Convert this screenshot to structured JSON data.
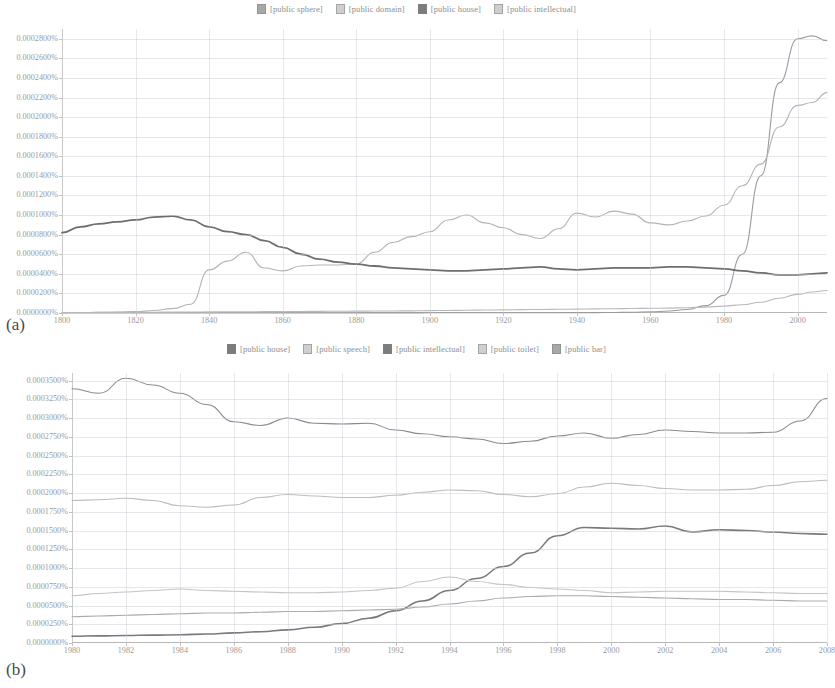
{
  "figure": {
    "panels": [
      {
        "id": "a",
        "caption": "(a)"
      },
      {
        "id": "b",
        "caption": "(b)"
      }
    ]
  },
  "panel_a": {
    "caption": "(a)",
    "legend": [
      {
        "label": "[public sphere]",
        "tone": "mid"
      },
      {
        "label": "[public domain]",
        "tone": "light"
      },
      {
        "label": "[public house]",
        "tone": "dark"
      },
      {
        "label": "[public intellectual]",
        "tone": "light"
      }
    ],
    "yticks": [
      "0.0000000%",
      "0.0000200%",
      "0.0000400%",
      "0.0000600%",
      "0.0000800%",
      "0.0001000%",
      "0.0001200%",
      "0.0001400%",
      "0.0001600%",
      "0.0001800%",
      "0.0002000%",
      "0.0002200%",
      "0.0002400%",
      "0.0002600%",
      "0.0002800%"
    ],
    "xticks": [
      "1800",
      "1820",
      "1840",
      "1860",
      "1880",
      "1900",
      "1920",
      "1940",
      "1960",
      "1980",
      "2000"
    ]
  },
  "panel_b": {
    "caption": "(b)",
    "legend": [
      {
        "label": "[public house]",
        "tone": "dark"
      },
      {
        "label": "[public speech]",
        "tone": "light"
      },
      {
        "label": "[public intellectual]",
        "tone": "dark"
      },
      {
        "label": "[public toilet]",
        "tone": "light"
      },
      {
        "label": "[public bar]",
        "tone": "mid"
      }
    ],
    "yticks": [
      "0.0000000%",
      "0.0000250%",
      "0.0000500%",
      "0.0000750%",
      "0.0001000%",
      "0.0001250%",
      "0.0001500%",
      "0.0001750%",
      "0.0002000%",
      "0.0002250%",
      "0.0002500%",
      "0.0002750%",
      "0.0003000%",
      "0.0003250%",
      "0.0003500%"
    ],
    "xticks": [
      "1980",
      "1982",
      "1984",
      "1986",
      "1988",
      "1990",
      "1992",
      "1994",
      "1996",
      "1998",
      "2000",
      "2002",
      "2004",
      "2006",
      "2008"
    ]
  },
  "chart_data": [
    {
      "type": "line",
      "id": "a",
      "title": "",
      "xlabel": "",
      "ylabel": "",
      "xlim": [
        1800,
        2008
      ],
      "ylim": [
        0.0,
        0.00029
      ],
      "ytick_step": 2e-05,
      "xtick_step": 20,
      "grid": true,
      "legend_position": "top-center",
      "x": [
        1800,
        1805,
        1810,
        1815,
        1820,
        1825,
        1830,
        1835,
        1840,
        1845,
        1850,
        1855,
        1860,
        1865,
        1870,
        1875,
        1880,
        1885,
        1890,
        1895,
        1900,
        1905,
        1910,
        1915,
        1920,
        1925,
        1930,
        1935,
        1940,
        1945,
        1950,
        1955,
        1960,
        1965,
        1970,
        1975,
        1980,
        1985,
        1990,
        1995,
        2000,
        2004,
        2008
      ],
      "series": [
        {
          "name": "[public sphere]",
          "color": "#9a9a9a",
          "values": [
            0.0,
            0.0,
            0.0,
            0.0,
            0.0,
            0.0,
            0.0,
            0.0,
            0.0,
            0.0,
            0.0,
            0.0,
            0.0,
            0.0,
            0.0,
            0.0,
            1e-07,
            1e-07,
            1e-07,
            1e-07,
            2e-07,
            2e-07,
            2e-07,
            2e-07,
            2e-07,
            3e-07,
            3e-07,
            3e-07,
            4e-07,
            4e-07,
            5e-07,
            7e-07,
            1.2e-06,
            2e-06,
            3.5e-06,
            7.5e-06,
            1.8e-05,
            6e-05,
            0.00014,
            0.000235,
            0.00028,
            0.000283,
            0.000278
          ]
        },
        {
          "name": "[public domain]",
          "color": "#b4b4b4",
          "values": [
            4e-07,
            5e-07,
            6e-07,
            9e-07,
            1.4e-06,
            2.5e-06,
            4.5e-06,
            9e-06,
            4.4e-05,
            5.3e-05,
            6.2e-05,
            4.6e-05,
            4.3e-05,
            4.8e-05,
            4.9e-05,
            4.9e-05,
            5e-05,
            6.2e-05,
            7.2e-05,
            7.8e-05,
            8.3e-05,
            9.5e-05,
            0.0001,
            9.2e-05,
            8.7e-05,
            8e-05,
            7.6e-05,
            8.6e-05,
            0.000102,
            9.8e-05,
            0.000104,
            0.000101,
            9.2e-05,
            9e-05,
            9.4e-05,
            9.9e-05,
            0.00011,
            0.00013,
            0.000152,
            0.00019,
            0.000212,
            0.000215,
            0.000225
          ]
        },
        {
          "name": "[public house]",
          "color": "#6e6e6e",
          "values": [
            8.2e-05,
            8.8e-05,
            9.1e-05,
            9.3e-05,
            9.5e-05,
            9.8e-05,
            9.9e-05,
            9.5e-05,
            8.8e-05,
            8.3e-05,
            8e-05,
            7.4e-05,
            6.7e-05,
            6e-05,
            5.5e-05,
            5.2e-05,
            5e-05,
            4.8e-05,
            4.6e-05,
            4.5e-05,
            4.4e-05,
            4.3e-05,
            4.3e-05,
            4.4e-05,
            4.5e-05,
            4.6e-05,
            4.7e-05,
            4.5e-05,
            4.4e-05,
            4.5e-05,
            4.6e-05,
            4.6e-05,
            4.6e-05,
            4.7e-05,
            4.7e-05,
            4.6e-05,
            4.5e-05,
            4.3e-05,
            4.1e-05,
            3.9e-05,
            3.9e-05,
            4e-05,
            4.1e-05
          ]
        },
        {
          "name": "[public intellectual]",
          "color": "#b9b9b9",
          "values": [
            5e-07,
            5e-07,
            6e-07,
            6e-07,
            7e-07,
            8e-07,
            9e-07,
            1e-06,
            1.1e-06,
            1.2e-06,
            1.3e-06,
            1.4e-06,
            1.5e-06,
            1.6e-06,
            1.7e-06,
            1.8e-06,
            1.9e-06,
            2e-06,
            2.1e-06,
            2.2e-06,
            2.4e-06,
            2.6e-06,
            2.8e-06,
            3e-06,
            3.2e-06,
            3.4e-06,
            3.6e-06,
            3.8e-06,
            4e-06,
            4.2e-06,
            4.4e-06,
            4.6e-06,
            4.8e-06,
            5e-06,
            5.4e-06,
            6e-06,
            7e-06,
            8.5e-06,
            1.1e-05,
            1.5e-05,
            1.9e-05,
            2.15e-05,
            2.3e-05
          ]
        }
      ]
    },
    {
      "type": "line",
      "id": "b",
      "title": "",
      "xlabel": "",
      "ylabel": "",
      "xlim": [
        1980,
        2008
      ],
      "ylim": [
        0.0,
        3.6e-05
      ],
      "ytick_step": 2.5e-06,
      "xtick_step": 2,
      "grid": true,
      "legend_position": "top-center",
      "x": [
        1980,
        1981,
        1982,
        1983,
        1984,
        1985,
        1986,
        1987,
        1988,
        1989,
        1990,
        1991,
        1992,
        1993,
        1994,
        1995,
        1996,
        1997,
        1998,
        1999,
        2000,
        2001,
        2002,
        2003,
        2004,
        2005,
        2006,
        2007,
        2008
      ],
      "series": [
        {
          "name": "[public house]",
          "color": "#8b8b8b",
          "values": [
            3.39e-05,
            3.33e-05,
            3.53e-05,
            3.44e-05,
            3.33e-05,
            3.18e-05,
            2.95e-05,
            2.9e-05,
            3e-05,
            2.93e-05,
            2.92e-05,
            2.93e-05,
            2.84e-05,
            2.79e-05,
            2.75e-05,
            2.72e-05,
            2.66e-05,
            2.69e-05,
            2.76e-05,
            2.8e-05,
            2.73e-05,
            2.78e-05,
            2.84e-05,
            2.82e-05,
            2.8e-05,
            2.8e-05,
            2.81e-05,
            2.96e-05,
            3.26e-05
          ]
        },
        {
          "name": "[public speech]",
          "color": "#bdbdbd",
          "values": [
            1.9e-05,
            1.91e-05,
            1.93e-05,
            1.9e-05,
            1.83e-05,
            1.81e-05,
            1.84e-05,
            1.94e-05,
            1.98e-05,
            1.96e-05,
            1.94e-05,
            1.94e-05,
            1.97e-05,
            2.01e-05,
            2.04e-05,
            2.03e-05,
            1.98e-05,
            1.95e-05,
            1.99e-05,
            2.08e-05,
            2.13e-05,
            2.1e-05,
            2.06e-05,
            2.04e-05,
            2.04e-05,
            2.05e-05,
            2.1e-05,
            2.15e-05,
            2.17e-05
          ]
        },
        {
          "name": "[public intellectual]",
          "color": "#7a7a7a",
          "values": [
            9e-07,
            9.5e-07,
            1e-06,
            1.05e-06,
            1.1e-06,
            1.2e-06,
            1.35e-06,
            1.5e-06,
            1.75e-06,
            2.1e-06,
            2.6e-06,
            3.3e-06,
            4.3e-06,
            5.6e-06,
            7e-06,
            8.6e-06,
            1.02e-05,
            1.2e-05,
            1.43e-05,
            1.54e-05,
            1.53e-05,
            1.52e-05,
            1.56e-05,
            1.48e-05,
            1.51e-05,
            1.5e-05,
            1.48e-05,
            1.46e-05,
            1.45e-05
          ]
        },
        {
          "name": "[public toilet]",
          "color": "#c4c4c4",
          "values": [
            6.3e-06,
            6.6e-06,
            6.8e-06,
            7e-06,
            7.2e-06,
            7e-06,
            6.9e-06,
            6.8e-06,
            6.7e-06,
            6.7e-06,
            6.8e-06,
            7e-06,
            7.3e-06,
            8.2e-06,
            8.8e-06,
            8.2e-06,
            7.8e-06,
            7.4e-06,
            7.2e-06,
            7e-06,
            6.7e-06,
            6.8e-06,
            6.9e-06,
            6.9e-06,
            6.9e-06,
            6.8e-06,
            6.7e-06,
            6.6e-06,
            6.6e-06
          ]
        },
        {
          "name": "[public bar]",
          "color": "#ababab",
          "values": [
            3.5e-06,
            3.6e-06,
            3.7e-06,
            3.8e-06,
            3.9e-06,
            4e-06,
            4e-06,
            4.1e-06,
            4.2e-06,
            4.2e-06,
            4.3e-06,
            4.4e-06,
            4.5e-06,
            4.8e-06,
            5.2e-06,
            5.6e-06,
            6e-06,
            6.2e-06,
            6.3e-06,
            6.3e-06,
            6.2e-06,
            6.1e-06,
            6e-06,
            5.9e-06,
            5.8e-06,
            5.8e-06,
            5.7e-06,
            5.6e-06,
            5.6e-06
          ]
        }
      ]
    }
  ]
}
